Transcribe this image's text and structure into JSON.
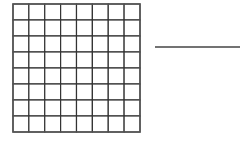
{
  "diagram": {
    "grid": {
      "rows": 8,
      "cols": 8,
      "x": 13,
      "y": 4,
      "width": 127,
      "height": 128,
      "stroke_color": "#333333",
      "outer_stroke_color": "#555555"
    },
    "line": {
      "x1": 155,
      "y1": 47,
      "x2": 240,
      "y2": 47,
      "stroke_color": "#444444"
    }
  }
}
